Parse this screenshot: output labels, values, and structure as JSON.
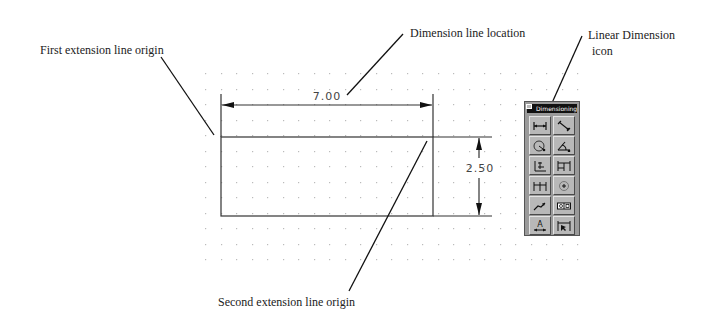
{
  "annotations": {
    "first_extension": "First extension line origin",
    "dimension_line": "Dimension line location",
    "linear_dimension_line1": "Linear Dimension",
    "linear_dimension_line2": "icon",
    "second_extension": "Second extension line origin"
  },
  "drawing": {
    "horizontal_dimension": "7.00",
    "vertical_dimension": "2.50",
    "grid": {
      "x_start": 205,
      "x_end": 585,
      "y_start": 73,
      "y_end": 262,
      "spacing": 15.5
    },
    "rectangle": {
      "x": 221,
      "y": 137,
      "width": 212,
      "height": 79
    }
  },
  "toolbar": {
    "title": "Dimensioning",
    "buttons": [
      {
        "name": "linear-dimension",
        "icon": "linear-dimension-icon"
      },
      {
        "name": "aligned-dimension",
        "icon": "aligned-dimension-icon"
      },
      {
        "name": "radius-dimension",
        "icon": "radius-dimension-icon"
      },
      {
        "name": "angular-dimension",
        "icon": "angular-dimension-icon"
      },
      {
        "name": "ordinate-dimension",
        "icon": "ordinate-dimension-icon"
      },
      {
        "name": "baseline-dimension",
        "icon": "baseline-dimension-icon"
      },
      {
        "name": "continue-dimension",
        "icon": "continue-dimension-icon"
      },
      {
        "name": "center-mark",
        "icon": "center-mark-icon"
      },
      {
        "name": "leader",
        "icon": "leader-icon"
      },
      {
        "name": "tolerance",
        "icon": "tolerance-icon"
      },
      {
        "name": "dimension-style",
        "icon": "dimension-style-icon"
      },
      {
        "name": "dimension-edit",
        "icon": "dimension-edit-icon"
      }
    ]
  }
}
